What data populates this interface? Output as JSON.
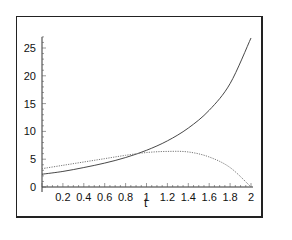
{
  "chart_data": {
    "type": "line",
    "title": "",
    "xlabel": "t",
    "ylabel": "",
    "xlim": [
      0,
      2
    ],
    "ylim": [
      0,
      27
    ],
    "grid": false,
    "legend": null,
    "x_ticks": [
      "0.2",
      "0.4",
      "0.6",
      "0.8",
      "1",
      "1.2",
      "1.4",
      "1.6",
      "1.8",
      "2"
    ],
    "y_ticks": [
      "0",
      "5",
      "10",
      "15",
      "20",
      "25"
    ],
    "x": [
      0,
      0.2,
      0.4,
      0.6,
      0.8,
      1.0,
      1.2,
      1.4,
      1.6,
      1.8,
      2.0
    ],
    "series": [
      {
        "name": "solid",
        "style": "solid",
        "color": "#333333",
        "values": [
          2.3,
          2.8,
          3.5,
          4.3,
          5.3,
          6.6,
          8.3,
          10.6,
          13.8,
          18.6,
          26.8
        ]
      },
      {
        "name": "dotted",
        "style": "dotted",
        "color": "#777777",
        "values": [
          3.3,
          3.9,
          4.5,
          5.1,
          5.7,
          6.2,
          6.4,
          6.3,
          5.4,
          3.5,
          0.0
        ]
      }
    ]
  }
}
